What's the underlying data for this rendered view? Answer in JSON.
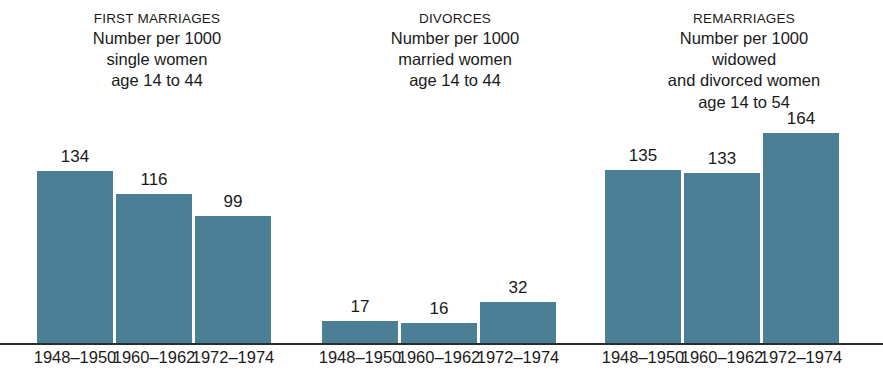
{
  "chart_data": {
    "type": "bar",
    "title": "",
    "xlabel": "",
    "ylabel": "",
    "ylim": [
      0,
      175
    ],
    "grid": false,
    "legend": "none",
    "categories": [
      "1948–1950",
      "1960–1962",
      "1972–1974"
    ],
    "groups": [
      {
        "key": "first-marriages",
        "title": "FIRST MARRIAGES",
        "subtitle_lines": [
          "Number per 1000",
          "single women",
          "age 14 to 44"
        ],
        "unit": "Number per 1000 single women age 14 to 44",
        "categories": [
          "1948–1950",
          "1960–1962",
          "1972–1974"
        ],
        "values": [
          134,
          116,
          99
        ]
      },
      {
        "key": "divorces",
        "title": "DIVORCES",
        "subtitle_lines": [
          "Number per 1000",
          "married women",
          "age 14 to 44"
        ],
        "unit": "Number per 1000 married women age 14 to 44",
        "categories": [
          "1948–1950",
          "1960–1962",
          "1972–1974"
        ],
        "values": [
          17,
          16,
          32
        ]
      },
      {
        "key": "remarriages",
        "title": "REMARRIAGES",
        "subtitle_lines": [
          "Number per 1000",
          "widowed",
          "and divorced women",
          "age 14 to 54"
        ],
        "unit": "Number per 1000 widowed and divorced women age 14 to 54",
        "categories": [
          "1948–1950",
          "1960–1962",
          "1972–1974"
        ],
        "values": [
          135,
          133,
          164
        ]
      }
    ],
    "series": [
      {
        "name": "FIRST MARRIAGES",
        "values": [
          134,
          116,
          99
        ]
      },
      {
        "name": "DIVORCES",
        "values": [
          17,
          16,
          32
        ]
      },
      {
        "name": "REMARRIAGES",
        "values": [
          135,
          133,
          164
        ]
      }
    ],
    "colors": {
      "bar": "#4a7f96",
      "text": "#1a1a1a",
      "axis": "#2b2b2b",
      "background": "#ffffff"
    }
  },
  "headers": {
    "first": {
      "title": "FIRST MARRIAGES",
      "line1": "Number per 1000",
      "line2": "single women",
      "line3": "age 14 to 44"
    },
    "divorces": {
      "title": "DIVORCES",
      "line1": "Number per 1000",
      "line2": "married women",
      "line3": "age 14 to 44"
    },
    "remarriages": {
      "title": "REMARRIAGES",
      "line1": "Number per 1000",
      "line2": "widowed",
      "line3": "and divorced women",
      "line4": "age 14 to 54"
    }
  },
  "bars": [
    {
      "id": "fm-1948",
      "label": "134"
    },
    {
      "id": "fm-1960",
      "label": "116"
    },
    {
      "id": "fm-1972",
      "label": "99"
    },
    {
      "id": "dv-1948",
      "label": "17"
    },
    {
      "id": "dv-1960",
      "label": "16"
    },
    {
      "id": "dv-1972",
      "label": "32"
    },
    {
      "id": "rm-1948",
      "label": "135"
    },
    {
      "id": "rm-1960",
      "label": "133"
    },
    {
      "id": "rm-1972",
      "label": "164"
    }
  ],
  "ticks": [
    {
      "id": "fm-1948",
      "label": "1948–1950"
    },
    {
      "id": "fm-1960",
      "label": "1960–1962"
    },
    {
      "id": "fm-1972",
      "label": "1972–1974"
    },
    {
      "id": "dv-1948",
      "label": "1948–1950"
    },
    {
      "id": "dv-1960",
      "label": "1960–1962"
    },
    {
      "id": "dv-1972",
      "label": "1972–1974"
    },
    {
      "id": "rm-1948",
      "label": "1948–1950"
    },
    {
      "id": "rm-1960",
      "label": "1960–1962"
    },
    {
      "id": "rm-1972",
      "label": "1972–1974"
    }
  ]
}
